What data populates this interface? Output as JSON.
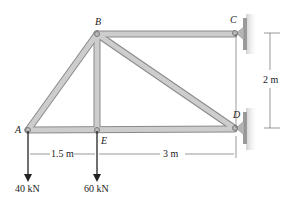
{
  "nodes": {
    "A": {
      "label": "A"
    },
    "B": {
      "label": "B"
    },
    "C": {
      "label": "C"
    },
    "D": {
      "label": "D"
    },
    "E": {
      "label": "E"
    }
  },
  "dimensions": {
    "AE": "1.5 m",
    "ED": "3 m",
    "CD": "2 m"
  },
  "loads": {
    "A": "40 kN",
    "E": "60 kN"
  },
  "colors": {
    "member_fill": "#c9c9c9",
    "member_edge": "#8a8a8a",
    "wall": "#9a9a9a",
    "arrow": "#222222"
  }
}
